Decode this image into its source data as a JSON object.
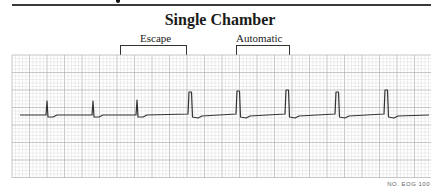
{
  "figure": {
    "title": "Single Chamber",
    "annotations": [
      {
        "label": "Escape",
        "bracket_x_start": 120,
        "bracket_x_end": 185
      },
      {
        "label": "Automatic",
        "bracket_x_start": 236,
        "bracket_x_end": 288
      }
    ],
    "footnote": "NO. EOG 100",
    "colors": {
      "trace": "#333333",
      "grid_minor": "#d6d6d6",
      "grid_major": "#b0b0b0",
      "rule": "#3a3a3a"
    }
  },
  "ecg_strip": {
    "grid": {
      "x": 12,
      "y": 55,
      "width": 419,
      "height": 123,
      "minor_px": 3.5,
      "major_every": 5
    },
    "baseline_y": 115,
    "complexes": [
      {
        "x": 47,
        "peak_y": 101,
        "type": "intrinsic"
      },
      {
        "x": 93,
        "peak_y": 101,
        "type": "intrinsic"
      },
      {
        "x": 137,
        "peak_y": 100,
        "type": "intrinsic"
      },
      {
        "x": 190,
        "peak_y": 92,
        "type": "paced"
      },
      {
        "x": 238,
        "peak_y": 91,
        "type": "paced"
      },
      {
        "x": 287,
        "peak_y": 90,
        "type": "paced"
      },
      {
        "x": 337,
        "peak_y": 92,
        "type": "paced"
      },
      {
        "x": 386,
        "peak_y": 90,
        "type": "paced"
      }
    ]
  }
}
